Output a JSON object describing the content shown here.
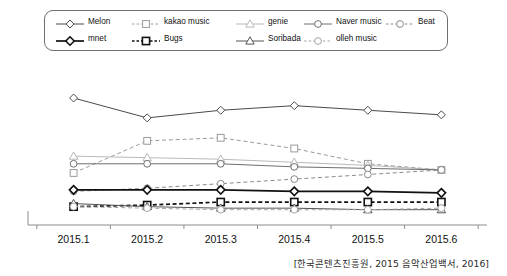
{
  "caption": "[한국콘텐츠진흥원, 2015 음악산업백서, 2016]",
  "legend": {
    "rows": [
      [
        {
          "label": "Melon",
          "marker": "diamond",
          "line": "solid",
          "color": "#4a4a4a",
          "weight": "normal"
        },
        {
          "label": "kakao music",
          "marker": "square",
          "line": "dashed",
          "color": "#9a9a9a",
          "weight": "normal"
        },
        {
          "label": "genie",
          "marker": "triangle",
          "line": "solid",
          "color": "#b9b9b9",
          "weight": "normal"
        },
        {
          "label": "Naver music",
          "marker": "circle",
          "line": "solid",
          "color": "#6e6e6e",
          "weight": "normal"
        },
        {
          "label": "Beat",
          "marker": "circle",
          "line": "dashed",
          "color": "#8a8a8a",
          "weight": "normal"
        }
      ],
      [
        {
          "label": "mnet",
          "marker": "diamond",
          "line": "solid",
          "color": "#111111",
          "weight": "bold"
        },
        {
          "label": "Bugs",
          "marker": "square",
          "line": "dashed",
          "color": "#111111",
          "weight": "bold"
        },
        {
          "label": "Soribada",
          "marker": "triangle",
          "line": "solid",
          "color": "#555555",
          "weight": "normal"
        },
        {
          "label": "olleh music",
          "marker": "circle",
          "line": "dashed",
          "color": "#a5a5a5",
          "weight": "normal"
        }
      ]
    ]
  },
  "chart_data": {
    "type": "line",
    "title": "",
    "xlabel": "",
    "ylabel": "",
    "grid": false,
    "legend_position": "top",
    "categories": [
      "2015.1",
      "2015.2",
      "2015.3",
      "2015.4",
      "2015.5",
      "2015.6"
    ],
    "ylim": [
      0,
      100
    ],
    "series": [
      {
        "name": "Melon",
        "marker": "diamond",
        "line": "solid",
        "color": "#4a4a4a",
        "weight": "normal",
        "values": [
          83,
          70,
          75,
          78,
          75,
          72
        ]
      },
      {
        "name": "kakao music",
        "marker": "square",
        "line": "dashed",
        "color": "#9a9a9a",
        "weight": "normal",
        "values": [
          34,
          55,
          57,
          50,
          40,
          36
        ]
      },
      {
        "name": "genie",
        "marker": "triangle",
        "line": "solid",
        "color": "#b9b9b9",
        "weight": "normal",
        "values": [
          45,
          44,
          43,
          41,
          39,
          36
        ]
      },
      {
        "name": "Naver music",
        "marker": "circle",
        "line": "solid",
        "color": "#6e6e6e",
        "weight": "normal",
        "values": [
          40,
          40,
          40,
          38,
          37,
          36
        ]
      },
      {
        "name": "Beat",
        "marker": "circle",
        "line": "dashed",
        "color": "#8a8a8a",
        "weight": "normal",
        "values": [
          22,
          24,
          27,
          30,
          33,
          36
        ]
      },
      {
        "name": "mnet",
        "marker": "diamond",
        "line": "solid",
        "color": "#111111",
        "weight": "bold",
        "values": [
          23,
          23,
          23,
          22,
          22,
          21
        ]
      },
      {
        "name": "Bugs",
        "marker": "square",
        "line": "dashed",
        "color": "#111111",
        "weight": "bold",
        "values": [
          12,
          13,
          15,
          15,
          15,
          15
        ]
      },
      {
        "name": "Soribada",
        "marker": "triangle",
        "line": "solid",
        "color": "#555555",
        "weight": "normal",
        "values": [
          14,
          12,
          11,
          11,
          10,
          10
        ]
      },
      {
        "name": "olleh music",
        "marker": "circle",
        "line": "dashed",
        "color": "#a5a5a5",
        "weight": "normal",
        "values": [
          12,
          11,
          10,
          10,
          10,
          11
        ]
      }
    ]
  }
}
